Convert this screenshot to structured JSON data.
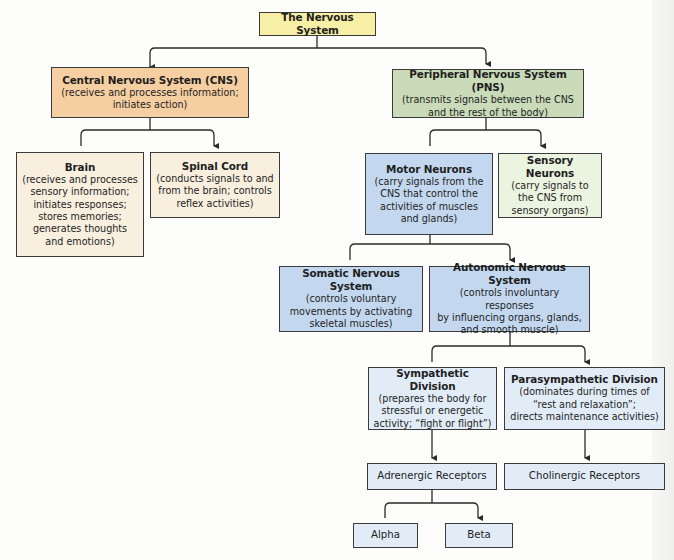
{
  "diagram": {
    "root": {
      "title": "The Nervous System"
    },
    "cns": {
      "title": "Central Nervous System (CNS)",
      "desc": "(receives and processes information;\ninitiates action)"
    },
    "pns": {
      "title": "Peripheral Nervous System (PNS)",
      "desc": "(transmits signals between the CNS\nand the rest of the body)"
    },
    "brain": {
      "title": "Brain",
      "desc": "(receives and processes\nsensory information;\ninitiates responses;\nstores memories;\ngenerates thoughts\nand emotions)"
    },
    "spinal_cord": {
      "title": "Spinal Cord",
      "desc": "(conducts signals to and\nfrom the brain; controls\nreflex activities)"
    },
    "motor_neurons": {
      "title": "Motor Neurons",
      "desc": "(carry signals from the\nCNS that control the\nactivities of muscles\nand glands)"
    },
    "sensory_neurons": {
      "title": "Sensory Neurons",
      "desc": "(carry signals to\nthe CNS from\nsensory organs)"
    },
    "somatic": {
      "title": "Somatic Nervous System",
      "desc": "(controls voluntary\nmovements by activating\nskeletal muscles)"
    },
    "autonomic": {
      "title": "Autonomic Nervous System",
      "desc": "(controls involuntary responses\nby influencing organs, glands,\nand smooth muscle)"
    },
    "sympathetic": {
      "title": "Sympathetic Division",
      "desc": "(prepares the body for\nstressful or energetic\nactivity; “fight or flight”)"
    },
    "parasympathetic": {
      "title": "Parasympathetic Division",
      "desc": "(dominates during times of\n“rest and relaxation”;\ndirects maintenance activities)"
    },
    "adrenergic": {
      "label": "Adrenergic Receptors"
    },
    "cholinergic": {
      "label": "Cholinergic Receptors"
    },
    "alpha": {
      "label": "Alpha"
    },
    "beta": {
      "label": "Beta"
    }
  },
  "colors": {
    "root": "#f7efa6",
    "cns": "#f5cfa2",
    "cns_children": "#f8efdf",
    "pns": "#c9dbb9",
    "sensory": "#ebf3e1",
    "motor_and_somatic_autonomic": "#c3d8ee",
    "autonomic_descendants": "#e1ecf6",
    "line": "#2a2a2a"
  }
}
